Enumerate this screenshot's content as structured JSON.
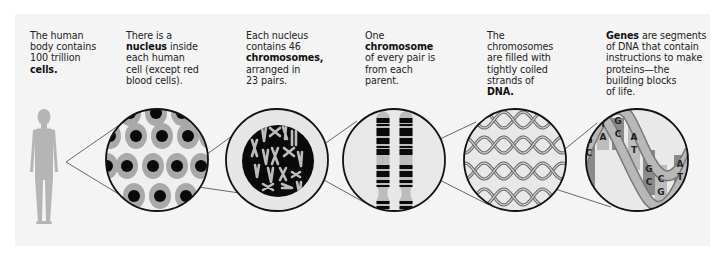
{
  "diagram": {
    "captions": [
      {
        "pre": "The human body contains 100 trillion ",
        "bold": "cells.",
        "post": ""
      },
      {
        "pre": "There is a ",
        "bold": "nucleus",
        "post": " inside each human cell (except red blood cells)."
      },
      {
        "pre": "Each nucleus contains 46 ",
        "bold": "chromosomes,",
        "post": " arranged in 23 pairs."
      },
      {
        "pre": "One ",
        "bold": "chromosome",
        "post": " of every pair is from each parent."
      },
      {
        "pre": "The chromosomes are filled with tightly coiled strands of ",
        "bold": "DNA.",
        "post": ""
      },
      {
        "pre": "",
        "bold": "Genes",
        "post": " are segments of DNA that contain instructions to make proteins—the building blocks of life."
      }
    ],
    "caption_lines": [
      [
        "The human",
        "body contains",
        "100 trillion",
        "**cells.**"
      ],
      [
        "There is a",
        "**nucleus** inside",
        "each human",
        "cell (except red",
        "blood cells)."
      ],
      [
        "Each nucleus",
        "contains 46",
        "**chromosomes,**",
        "arranged in",
        "23 pairs."
      ],
      [
        "One",
        "**chromosome**",
        "of every pair is",
        "from each",
        "parent."
      ],
      [
        "The",
        "chromosomes",
        "are filled with",
        "tightly coiled",
        "strands of",
        "**DNA.**"
      ],
      [
        "**Genes** are segments",
        "of DNA that contain",
        "instructions to make",
        "proteins—the",
        "building blocks",
        "of life."
      ]
    ],
    "panels": [
      {
        "name": "human-body",
        "icon": "human-silhouette-icon"
      },
      {
        "name": "cells",
        "icon": "cells-with-nuclei-icon"
      },
      {
        "name": "nucleus",
        "icon": "nucleus-chromosomes-icon"
      },
      {
        "name": "chromosome-pair",
        "icon": "chromosome-pair-icon"
      },
      {
        "name": "dna-strands",
        "icon": "coiled-dna-icon"
      },
      {
        "name": "gene",
        "icon": "dna-double-helix-icon"
      }
    ],
    "base_pairs": [
      {
        "top": "G",
        "bottom": "C"
      },
      {
        "top": "T",
        "bottom": "A"
      },
      {
        "top": "G",
        "bottom": "C"
      },
      {
        "top": "A",
        "bottom": "T"
      },
      {
        "top": "G",
        "bottom": "C"
      },
      {
        "top": "C",
        "bottom": "G"
      },
      {
        "top": "A",
        "bottom": "T"
      }
    ],
    "colors": {
      "panel_bg": "#f4f4f4",
      "silhouette": "#b5b5b5",
      "cell_gray": "#a9a9a9",
      "nucleus_black": "#0a0a0a",
      "circle_fill": "#e8e8e8",
      "outline": "#111111",
      "helix_strand": "#9a9a9a",
      "helix_dark": "#7d7d7d"
    }
  }
}
